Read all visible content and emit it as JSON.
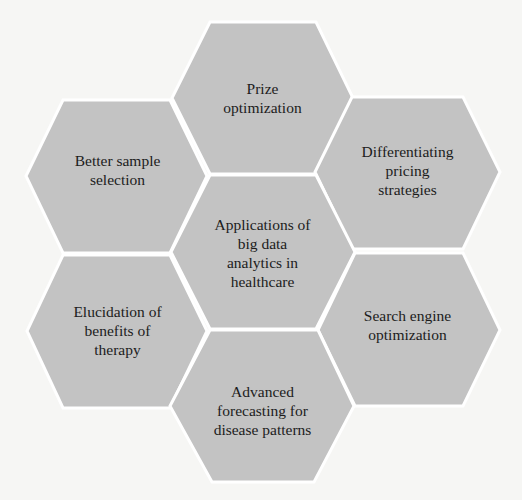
{
  "diagram": {
    "type": "hexagon-cluster",
    "fill_color": "#c3c3c3",
    "border_color": "#ffffff",
    "center": {
      "label": "Applications of big data analytics in healthcare",
      "lines": [
        "Applications of",
        "big data",
        "analytics in",
        "healthcare"
      ]
    },
    "nodes": [
      {
        "position": "top",
        "label": "Prize optimization",
        "lines": [
          "Prize",
          "optimization"
        ]
      },
      {
        "position": "upper-right",
        "label": "Differentiating pricing strategies",
        "lines": [
          "Differentiating",
          "pricing",
          "strategies"
        ]
      },
      {
        "position": "lower-right",
        "label": "Search engine optimization",
        "lines": [
          "Search engine",
          "optimization"
        ]
      },
      {
        "position": "bottom",
        "label": "Advanced forecasting for disease patterns",
        "lines": [
          "Advanced",
          "forecasting for",
          "disease patterns"
        ]
      },
      {
        "position": "lower-left",
        "label": "Elucidation of benefits of therapy",
        "lines": [
          "Elucidation of",
          "benefits of",
          "therapy"
        ]
      },
      {
        "position": "upper-left",
        "label": "Better sample selection",
        "lines": [
          "Better sample",
          "selection"
        ]
      }
    ]
  }
}
